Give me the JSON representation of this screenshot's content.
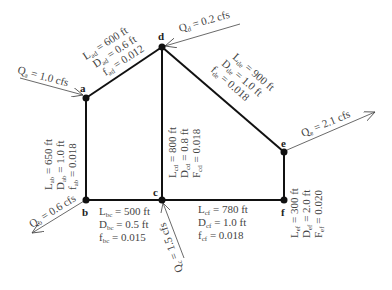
{
  "nodes": {
    "a": {
      "label": "a"
    },
    "b": {
      "label": "b"
    },
    "c": {
      "label": "c"
    },
    "d": {
      "label": "d"
    },
    "e": {
      "label": "e"
    },
    "f": {
      "label": "f"
    }
  },
  "flows": {
    "a": "Qₐ = 1.0 cfs",
    "b": "Qᵦ = 0.6 cfs",
    "c": "Qᴄ = 1.5 cfs",
    "d": "Qᴅ = 0.2 cfs",
    "e": "Qₑ = 2.1 cfs"
  },
  "flow_text": {
    "a": {
      "q": "Q",
      "sub": "a",
      "rest": " = 1.0 cfs"
    },
    "b": {
      "q": "Q",
      "sub": "b",
      "rest": " = 0.6 cfs"
    },
    "c": {
      "q": "Q",
      "sub": "c",
      "rest": " = 1.5 cfs"
    },
    "d": {
      "q": "Q",
      "sub": "d",
      "rest": " = 0.2 cfs"
    },
    "e": {
      "q": "Q",
      "sub": "e",
      "rest": " = 2.1 cfs"
    }
  },
  "pipes": {
    "ad": {
      "L": "= 600 ft",
      "D": "= 0.6 ft",
      "f": "= 0.012",
      "Lsym": "L",
      "Dsym": "D",
      "fsym": "f",
      "sub": "ad"
    },
    "ab": {
      "L": "= 650 ft",
      "D": "= 1.0 ft",
      "f": "= 0.018",
      "Lsym": "L",
      "Dsym": "D",
      "fsym": "f",
      "sub": "ab"
    },
    "cd": {
      "L": "= 800 ft",
      "D": "= 0.8 ft",
      "f": "= 0.018",
      "Lsym": "L",
      "Dsym": "D",
      "fsym": "F",
      "sub": "cd"
    },
    "de": {
      "L": "= 900 ft",
      "D": "= 1.0 ft",
      "f": "= 0.018",
      "Lsym": "L",
      "Dsym": "D",
      "fsym": "f",
      "sub": "de"
    },
    "bc": {
      "L": "= 500 ft",
      "D": "= 0.5 ft",
      "f": "= 0.015",
      "Lsym": "L",
      "Dsym": "D",
      "fsym": "f",
      "sub": "bc"
    },
    "cf": {
      "L": "= 780 ft",
      "D": "= 1.0 ft",
      "f": "= 0.018",
      "Lsym": "L",
      "Dsym": "D",
      "fsym": "f",
      "sub": "cf"
    },
    "ef": {
      "L": "= 300 ft",
      "D": "= 2.0 ft",
      "f": "= 0.020",
      "Lsym": "L",
      "Dsym": "D",
      "fsym": "F",
      "sub": "ef"
    }
  }
}
